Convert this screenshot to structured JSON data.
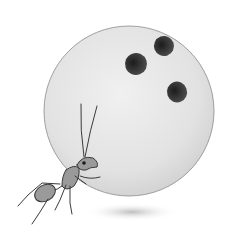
{
  "illustration": {
    "subject": "Ant carrying a bowling ball",
    "elements": [
      "bowling-ball",
      "finger-holes",
      "ant",
      "shadow"
    ],
    "colors": {
      "background": "#ffffff",
      "ball": "#e4e4e4",
      "ball_outline": "#8a8a8a",
      "holes": "#2a2a2a",
      "ant": "#9a9a9a",
      "ant_outline": "#3a3a3a",
      "shadow": "#c8c8c8"
    }
  }
}
